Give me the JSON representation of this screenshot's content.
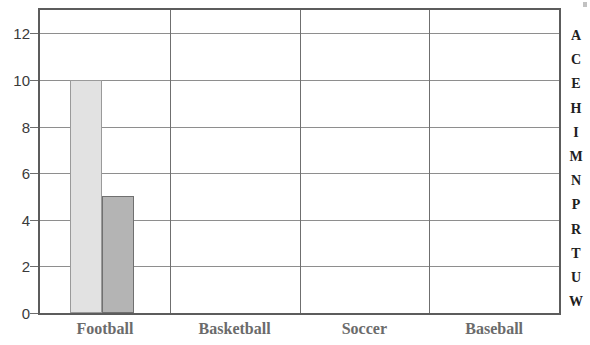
{
  "chart_data": {
    "type": "bar",
    "title": "",
    "subtitle": "",
    "xlabel": "",
    "ylabel": "",
    "categories": [
      "Football",
      "Basketball",
      "Soccer",
      "Baseball"
    ],
    "series": [
      {
        "name": "series-1",
        "color": "#e2e2e2",
        "border": "#9a9a9a",
        "values": [
          10,
          0,
          0,
          0
        ]
      },
      {
        "name": "series-2",
        "color": "#b4b4b4",
        "border": "#707070",
        "values": [
          5,
          0,
          0,
          0
        ]
      }
    ],
    "ylim": [
      0,
      13
    ],
    "yticks": [
      0,
      2,
      4,
      6,
      8,
      10,
      12
    ],
    "ytick_labels": [
      "0",
      "2",
      "4",
      "6",
      "8",
      "10",
      "12"
    ],
    "grid": {
      "horizontal": true,
      "vertical": true
    },
    "legend": {
      "position": "none",
      "entries": []
    },
    "annotations": []
  },
  "side_letters": [
    "A",
    "C",
    "E",
    "H",
    "I",
    "M",
    "N",
    "P",
    "R",
    "T",
    "U",
    "W"
  ],
  "colors": {
    "plot_border": "#5c5c5c",
    "gridline": "#8e8e8e",
    "vertical_gridline": "#6f6f6f",
    "bar_light": "#e2e2e2",
    "bar_light_border": "#9a9a9a",
    "bar_dark": "#b4b4b4",
    "bar_dark_border": "#707070",
    "y_tick_text": "#3a3a3a",
    "x_label_text": "#6b6b6b",
    "side_letter_text": "#202020",
    "background": "#ffffff"
  }
}
